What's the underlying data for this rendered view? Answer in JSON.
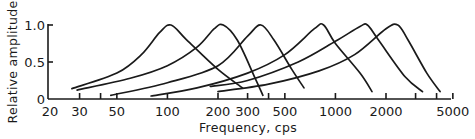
{
  "chart_data": {
    "type": "line",
    "title": "",
    "xlabel": "Frequency, cps",
    "ylabel": "Relative amplitude",
    "xscale": "log",
    "xlim": [
      20,
      5000
    ],
    "ylim": [
      0,
      1.0
    ],
    "grid": false,
    "legend": null,
    "x_ticks": [
      20,
      30,
      40,
      50,
      100,
      200,
      300,
      400,
      500,
      1000,
      2000,
      3000,
      4000,
      5000
    ],
    "x_tick_labels": [
      "20",
      "30",
      "",
      "50",
      "100",
      "200",
      "300",
      "",
      "500",
      "1000",
      "2000",
      "",
      "",
      "5000"
    ],
    "y_ticks": [
      0,
      0.5,
      1.0
    ],
    "y_tick_labels": [
      "0",
      "0.5",
      "1.0"
    ],
    "series": [
      {
        "name": "curve-1",
        "peak_freq": 100,
        "points": [
          [
            27,
            0.14
          ],
          [
            50,
            0.35
          ],
          [
            70,
            0.6
          ],
          [
            90,
            0.9
          ],
          [
            105,
            1.0
          ],
          [
            130,
            0.8
          ],
          [
            200,
            0.4
          ],
          [
            280,
            0.15
          ]
        ]
      },
      {
        "name": "curve-2",
        "peak_freq": 215,
        "points": [
          [
            29,
            0.12
          ],
          [
            60,
            0.28
          ],
          [
            100,
            0.45
          ],
          [
            150,
            0.7
          ],
          [
            190,
            0.95
          ],
          [
            215,
            1.0
          ],
          [
            260,
            0.8
          ],
          [
            330,
            0.3
          ],
          [
            370,
            0.05
          ]
        ]
      },
      {
        "name": "curve-3",
        "peak_freq": 360,
        "points": [
          [
            46,
            0.05
          ],
          [
            100,
            0.22
          ],
          [
            200,
            0.45
          ],
          [
            300,
            0.85
          ],
          [
            360,
            1.0
          ],
          [
            430,
            0.8
          ],
          [
            550,
            0.4
          ],
          [
            650,
            0.15
          ]
        ]
      },
      {
        "name": "curve-4",
        "peak_freq": 850,
        "points": [
          [
            80,
            0.04
          ],
          [
            150,
            0.15
          ],
          [
            300,
            0.35
          ],
          [
            500,
            0.6
          ],
          [
            750,
            0.95
          ],
          [
            850,
            1.0
          ],
          [
            1000,
            0.75
          ],
          [
            1400,
            0.35
          ],
          [
            1650,
            0.1
          ]
        ]
      },
      {
        "name": "curve-5",
        "peak_freq": 1500,
        "points": [
          [
            180,
            0.17
          ],
          [
            300,
            0.25
          ],
          [
            600,
            0.5
          ],
          [
            1000,
            0.78
          ],
          [
            1400,
            0.98
          ],
          [
            1550,
            1.0
          ],
          [
            1800,
            0.8
          ],
          [
            2600,
            0.3
          ],
          [
            3300,
            0.1
          ]
        ]
      },
      {
        "name": "curve-6",
        "peak_freq": 2350,
        "points": [
          [
            200,
            0.1
          ],
          [
            400,
            0.2
          ],
          [
            800,
            0.38
          ],
          [
            1300,
            0.6
          ],
          [
            2000,
            0.95
          ],
          [
            2350,
            1.0
          ],
          [
            2700,
            0.8
          ],
          [
            3500,
            0.35
          ],
          [
            4200,
            0.1
          ]
        ]
      }
    ]
  }
}
